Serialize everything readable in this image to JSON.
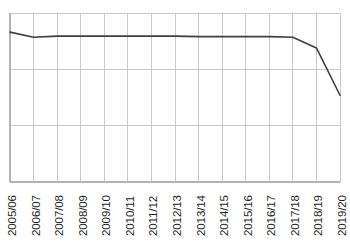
{
  "chart_data": {
    "type": "line",
    "title": "",
    "subtitle": "",
    "xlabel": "",
    "ylabel": "",
    "legend": [],
    "legend_position": "none",
    "grid": true,
    "grid_horizontal_count": 4,
    "grid_vertical_count": 15,
    "y_tick_labels": [],
    "ylim": [
      0,
      3
    ],
    "categories": [
      "2005/06",
      "2006/07",
      "2007/08",
      "2008/09",
      "2009/10",
      "2010/11",
      "2011/12",
      "2012/13",
      "2013/14",
      "2014/15",
      "2015/16",
      "2016/17",
      "2017/18",
      "2018/19",
      "2019/20"
    ],
    "values": [
      2.66,
      2.57,
      2.59,
      2.59,
      2.59,
      2.59,
      2.59,
      2.59,
      2.58,
      2.58,
      2.58,
      2.58,
      2.57,
      2.38,
      1.54
    ],
    "series": [
      {
        "name": "series-1",
        "color": "#3e3e3e",
        "values": [
          2.66,
          2.57,
          2.59,
          2.59,
          2.59,
          2.59,
          2.59,
          2.59,
          2.58,
          2.58,
          2.58,
          2.58,
          2.57,
          2.38,
          1.54
        ]
      }
    ],
    "annotations": []
  },
  "colors": {
    "line": "#3e3e3e",
    "grid": "#c3c3c3",
    "axis": "#b3b3b3",
    "background": "#ffffff",
    "label_text": "#231f20"
  },
  "axis": {
    "x_label_rotation_degrees": -90
  }
}
